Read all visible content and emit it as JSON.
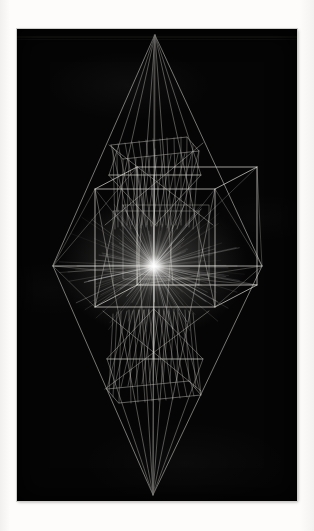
{
  "artwork": {
    "title": "Wireframe Hypersolid Plot",
    "medium_note": "vector line plot photographic print",
    "plate": {
      "x": 17,
      "y": 29,
      "width": 280,
      "height": 472,
      "background_color": "#050505",
      "border_color": "#cfcdc9"
    },
    "paper_color": "#fcfbf9",
    "line_color": "#e8e6e0",
    "glow_color": "#ffffff"
  },
  "chart_data": {
    "type": "scatter",
    "subtitle": "Nested polyhedra with ruled hyperboloids and radial burst",
    "xlabel": "",
    "ylabel": "",
    "xlim": [
      0,
      280
    ],
    "ylim": [
      0,
      472
    ],
    "grid": false,
    "legend_position": "none",
    "annotations": [],
    "geometry": {
      "center": {
        "x": 137,
        "y": 237
      },
      "top_apex": {
        "x": 138,
        "y": 6
      },
      "bottom_apex": {
        "x": 136,
        "y": 466
      },
      "octahedron": {
        "left": {
          "x": 36,
          "y": 237
        },
        "right": {
          "x": 245,
          "y": 237
        },
        "top": {
          "x": 138,
          "y": 6
        },
        "bottom": {
          "x": 136,
          "y": 466
        },
        "waist_top": {
          "x": 138,
          "y": 146
        },
        "waist_bottom": {
          "x": 137,
          "y": 330
        }
      },
      "cube": {
        "front_left": 78,
        "front_right": 198,
        "front_top": 160,
        "front_bottom": 278,
        "depth_dx": 42,
        "depth_dy": -22
      },
      "hyperboloid_upper": {
        "top_face_y": 110,
        "waist_y": 146,
        "bottom_y": 196,
        "top_half_width": 46,
        "waist_half_width": 28,
        "ruling_count": 26
      },
      "hyperboloid_lower": {
        "bottom_face_y": 372,
        "waist_y": 330,
        "top_y": 280,
        "bottom_half_width": 48,
        "waist_half_width": 28,
        "ruling_count": 26
      },
      "burst": {
        "center": {
          "x": 137,
          "y": 237
        },
        "ray_count": 150,
        "inner_radius": 4,
        "outer_radius_x": 96,
        "outer_radius_y": 74,
        "core_radius": 13
      },
      "horizontal_scan_line": {
        "y": 8,
        "x_start": 0,
        "x_end": 280
      },
      "central_axis_line": {
        "x": 137,
        "y_start": 6,
        "y_end": 466
      },
      "equator_line": {
        "y": 237,
        "x_start": 36,
        "x_end": 245
      }
    }
  }
}
